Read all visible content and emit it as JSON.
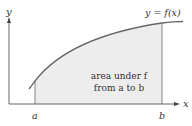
{
  "diagram": {
    "type": "area-under-curve",
    "axis_labels": {
      "x": "x",
      "y": "y"
    },
    "curve_label": "y = f(x)",
    "bounds": {
      "lower": "a",
      "upper": "b"
    },
    "region_label_line1": "area under f",
    "region_label_line2": "from a to b",
    "colors": {
      "curve": "#666666",
      "axes": "#555555",
      "fill": "#ededed",
      "text": "#333333"
    }
  }
}
